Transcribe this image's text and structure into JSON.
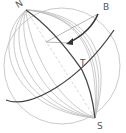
{
  "diagram": {
    "type": "sphere-meridians",
    "labels": {
      "north": "N",
      "south": "S",
      "point_b": "B",
      "point_t": "T"
    },
    "colors": {
      "meridian": "#bbbbbb",
      "highlight": "#444444",
      "dashed": "#cccccc",
      "label": "#555555"
    }
  }
}
